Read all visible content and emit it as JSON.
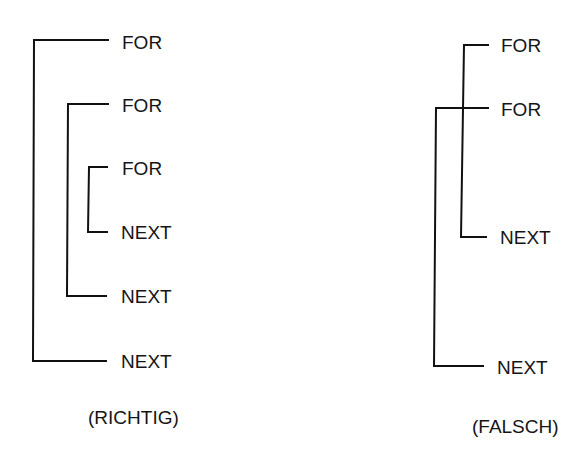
{
  "diagrams": [
    {
      "id": "richtig",
      "caption": "(RICHTIG)",
      "loops": [
        {
          "for_label": "FOR",
          "next_label": "NEXT"
        },
        {
          "for_label": "FOR",
          "next_label": "NEXT"
        },
        {
          "for_label": "FOR",
          "next_label": "NEXT"
        }
      ]
    },
    {
      "id": "falsch",
      "caption": "(FALSCH)",
      "loops": [
        {
          "for_label": "FOR",
          "next_label": "NEXT"
        },
        {
          "for_label": "FOR",
          "next_label": "NEXT"
        }
      ]
    }
  ],
  "colors": {
    "line": "#111111",
    "background": "#ffffff"
  }
}
